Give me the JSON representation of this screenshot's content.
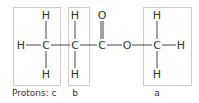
{
  "diagram": {
    "atoms": {
      "h_left": "H",
      "c1": "C",
      "c1_h_top": "H",
      "c1_h_bottom": "H",
      "c2": "C",
      "c2_h_top": "H",
      "c2_h_bottom": "H",
      "c3": "C",
      "o_carbonyl": "O",
      "o_ester": "O",
      "c4": "C",
      "c4_h_top": "H",
      "c4_h_bottom": "H",
      "h_right": "H"
    },
    "labels": {
      "c": "Protons: c",
      "b": "b",
      "a": "a"
    },
    "colors": {
      "text": "#333333",
      "bond": "#444444",
      "box": "#999999"
    }
  }
}
